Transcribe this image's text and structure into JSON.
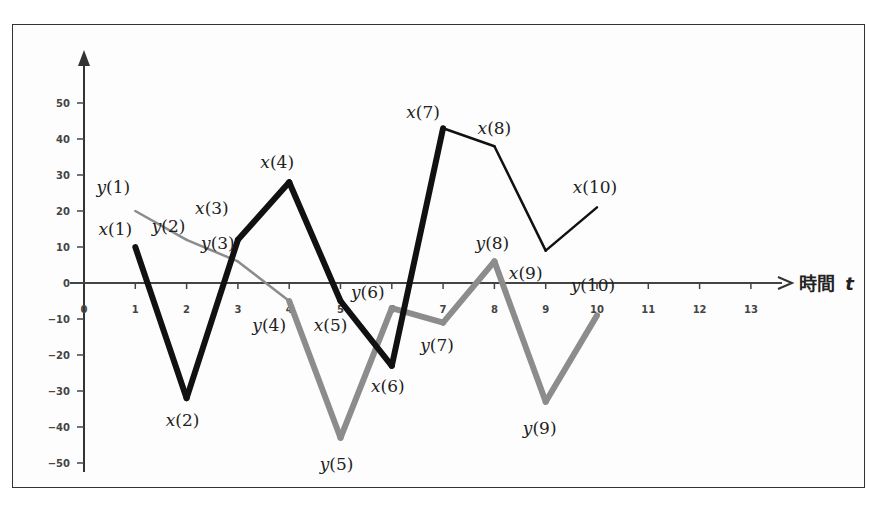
{
  "chart_data": {
    "type": "line",
    "title": "",
    "xlabel": "時間 t",
    "xlabel_text": "時間",
    "xlabel_var": "t",
    "ylabel": "",
    "x": [
      1,
      2,
      3,
      4,
      5,
      6,
      7,
      8,
      9,
      10
    ],
    "xlim": [
      0,
      13
    ],
    "ylim": [
      -50,
      50
    ],
    "x_ticks": [
      "0",
      "1",
      "2",
      "3",
      "4",
      "5",
      "6",
      "7",
      "8",
      "9",
      "10",
      "11",
      "12",
      "13"
    ],
    "y_ticks": [
      "50",
      "40",
      "30",
      "20",
      "10",
      "0",
      "-10",
      "-20",
      "-30",
      "-40",
      "-50"
    ],
    "grid": false,
    "legend": "none",
    "series": [
      {
        "name": "x",
        "color": "#111111",
        "values": [
          10,
          -32,
          12,
          28,
          -5,
          -23,
          43,
          38,
          9,
          21
        ],
        "labels": [
          "x(1)",
          "x(2)",
          "x(3)",
          "x(4)",
          "x(5)",
          "x(6)",
          "x(7)",
          "x(8)",
          "x(9)",
          "x(10)"
        ]
      },
      {
        "name": "y",
        "color": "#8c8c8c",
        "values": [
          20,
          12,
          6,
          -5,
          -43,
          -7,
          -11,
          6,
          -33,
          -9
        ],
        "labels": [
          "y(1)",
          "y(2)",
          "y(3)",
          "y(4)",
          "y(5)",
          "y(6)",
          "y(7)",
          "y(8)",
          "y(9)",
          "y(10)"
        ]
      }
    ]
  }
}
